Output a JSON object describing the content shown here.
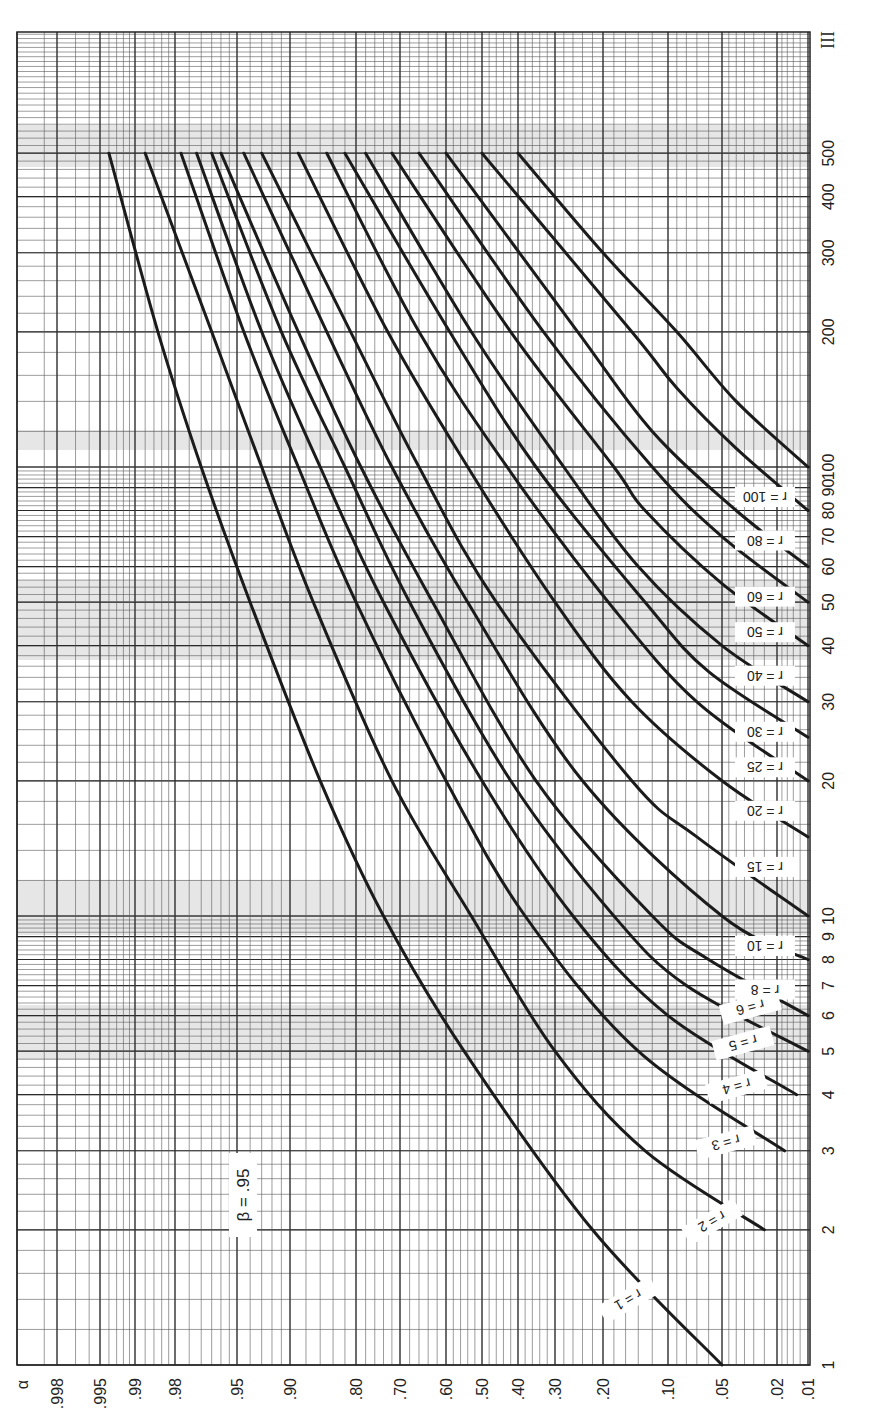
{
  "chart_data": {
    "type": "line",
    "title": "β = .95",
    "orientation": "rotated 90° (n axis vertical on right, α axis horizontal at bottom)",
    "beta_label": "β = .95",
    "page_label": "III",
    "xlabel": "α",
    "ylabel": "n",
    "x_axis": {
      "scale": "normal-probability (decreasing to the right)",
      "ticks": [
        ".998",
        ".995",
        ".99",
        ".98",
        ".95",
        ".90",
        ".80",
        ".70",
        ".60",
        ".50",
        ".40",
        ".30",
        ".20",
        ".10",
        ".05",
        ".02",
        ".01"
      ],
      "tick_values": [
        0.998,
        0.995,
        0.99,
        0.98,
        0.95,
        0.9,
        0.8,
        0.7,
        0.6,
        0.5,
        0.4,
        0.3,
        0.2,
        0.1,
        0.05,
        0.02,
        0.01
      ],
      "label": "α"
    },
    "y_axis": {
      "scale": "log",
      "ticks": [
        "1",
        "2",
        "3",
        "4",
        "5",
        "6",
        "7",
        "8",
        "9",
        "10",
        "15",
        "20",
        "30",
        "40",
        "50",
        "60",
        "70",
        "80",
        "90",
        "100",
        "200",
        "300",
        "400",
        "500"
      ],
      "tick_values": [
        1,
        2,
        3,
        4,
        5,
        6,
        7,
        8,
        9,
        10,
        20,
        30,
        40,
        50,
        60,
        70,
        80,
        90,
        100,
        200,
        300,
        400,
        500
      ],
      "range": [
        1,
        1000
      ]
    },
    "grid": true,
    "series": [
      {
        "name": "r = 1",
        "r": 1,
        "points": [
          {
            "n": 1,
            "alpha": 0.05
          },
          {
            "n": 2,
            "alpha": 0.22
          },
          {
            "n": 5,
            "alpha": 0.55
          },
          {
            "n": 10,
            "alpha": 0.74
          },
          {
            "n": 20,
            "alpha": 0.86
          },
          {
            "n": 50,
            "alpha": 0.94
          },
          {
            "n": 100,
            "alpha": 0.97
          },
          {
            "n": 200,
            "alpha": 0.985
          },
          {
            "n": 500,
            "alpha": 0.994
          }
        ]
      },
      {
        "name": "r = 2",
        "r": 2,
        "points": [
          {
            "n": 2,
            "alpha": 0.025
          },
          {
            "n": 3,
            "alpha": 0.13
          },
          {
            "n": 5,
            "alpha": 0.3
          },
          {
            "n": 10,
            "alpha": 0.53
          },
          {
            "n": 20,
            "alpha": 0.72
          },
          {
            "n": 50,
            "alpha": 0.87
          },
          {
            "n": 100,
            "alpha": 0.93
          },
          {
            "n": 200,
            "alpha": 0.965
          },
          {
            "n": 500,
            "alpha": 0.988
          }
        ]
      },
      {
        "name": "r = 3",
        "r": 3,
        "points": [
          {
            "n": 3,
            "alpha": 0.017
          },
          {
            "n": 5,
            "alpha": 0.14
          },
          {
            "n": 10,
            "alpha": 0.38
          },
          {
            "n": 20,
            "alpha": 0.6
          },
          {
            "n": 50,
            "alpha": 0.8
          },
          {
            "n": 100,
            "alpha": 0.89
          },
          {
            "n": 200,
            "alpha": 0.945
          },
          {
            "n": 500,
            "alpha": 0.978
          }
        ]
      },
      {
        "name": "r = 4",
        "r": 4,
        "points": [
          {
            "n": 4,
            "alpha": 0.013
          },
          {
            "n": 6,
            "alpha": 0.1
          },
          {
            "n": 10,
            "alpha": 0.26
          },
          {
            "n": 20,
            "alpha": 0.5
          },
          {
            "n": 50,
            "alpha": 0.74
          },
          {
            "n": 100,
            "alpha": 0.86
          },
          {
            "n": 200,
            "alpha": 0.93
          },
          {
            "n": 500,
            "alpha": 0.972
          }
        ]
      },
      {
        "name": "r = 5",
        "r": 5,
        "points": [
          {
            "n": 5,
            "alpha": 0.01
          },
          {
            "n": 7,
            "alpha": 0.08
          },
          {
            "n": 10,
            "alpha": 0.18
          },
          {
            "n": 20,
            "alpha": 0.42
          },
          {
            "n": 50,
            "alpha": 0.68
          },
          {
            "n": 100,
            "alpha": 0.82
          },
          {
            "n": 200,
            "alpha": 0.91
          },
          {
            "n": 500,
            "alpha": 0.965
          }
        ]
      },
      {
        "name": "r = 6",
        "r": 6,
        "points": [
          {
            "n": 6,
            "alpha": 0.01
          },
          {
            "n": 8,
            "alpha": 0.06
          },
          {
            "n": 10,
            "alpha": 0.12
          },
          {
            "n": 20,
            "alpha": 0.35
          },
          {
            "n": 50,
            "alpha": 0.63
          },
          {
            "n": 100,
            "alpha": 0.79
          },
          {
            "n": 200,
            "alpha": 0.89
          },
          {
            "n": 500,
            "alpha": 0.96
          }
        ]
      },
      {
        "name": "r = 8",
        "r": 8,
        "points": [
          {
            "n": 8,
            "alpha": 0.01
          },
          {
            "n": 10,
            "alpha": 0.05
          },
          {
            "n": 20,
            "alpha": 0.24
          },
          {
            "n": 50,
            "alpha": 0.54
          },
          {
            "n": 100,
            "alpha": 0.72
          },
          {
            "n": 200,
            "alpha": 0.85
          },
          {
            "n": 500,
            "alpha": 0.945
          }
        ]
      },
      {
        "name": "r = 10",
        "r": 10,
        "points": [
          {
            "n": 10,
            "alpha": 0.01
          },
          {
            "n": 15,
            "alpha": 0.07
          },
          {
            "n": 20,
            "alpha": 0.15
          },
          {
            "n": 50,
            "alpha": 0.46
          },
          {
            "n": 100,
            "alpha": 0.66
          },
          {
            "n": 200,
            "alpha": 0.81
          },
          {
            "n": 500,
            "alpha": 0.93
          }
        ]
      },
      {
        "name": "r = 15",
        "r": 15,
        "points": [
          {
            "n": 15,
            "alpha": 0.01
          },
          {
            "n": 20,
            "alpha": 0.05
          },
          {
            "n": 30,
            "alpha": 0.15
          },
          {
            "n": 50,
            "alpha": 0.3
          },
          {
            "n": 100,
            "alpha": 0.54
          },
          {
            "n": 200,
            "alpha": 0.73
          },
          {
            "n": 500,
            "alpha": 0.89
          }
        ]
      },
      {
        "name": "r = 20",
        "r": 20,
        "points": [
          {
            "n": 20,
            "alpha": 0.01
          },
          {
            "n": 30,
            "alpha": 0.07
          },
          {
            "n": 50,
            "alpha": 0.19
          },
          {
            "n": 100,
            "alpha": 0.43
          },
          {
            "n": 200,
            "alpha": 0.66
          },
          {
            "n": 500,
            "alpha": 0.85
          }
        ]
      },
      {
        "name": "r = 25",
        "r": 25,
        "points": [
          {
            "n": 25,
            "alpha": 0.01
          },
          {
            "n": 35,
            "alpha": 0.06
          },
          {
            "n": 50,
            "alpha": 0.13
          },
          {
            "n": 100,
            "alpha": 0.35
          },
          {
            "n": 200,
            "alpha": 0.59
          },
          {
            "n": 500,
            "alpha": 0.82
          }
        ]
      },
      {
        "name": "r = 30",
        "r": 30,
        "points": [
          {
            "n": 30,
            "alpha": 0.01
          },
          {
            "n": 40,
            "alpha": 0.05
          },
          {
            "n": 60,
            "alpha": 0.14
          },
          {
            "n": 100,
            "alpha": 0.28
          },
          {
            "n": 200,
            "alpha": 0.53
          },
          {
            "n": 500,
            "alpha": 0.78
          }
        ]
      },
      {
        "name": "r = 40",
        "r": 40,
        "points": [
          {
            "n": 40,
            "alpha": 0.01
          },
          {
            "n": 55,
            "alpha": 0.05
          },
          {
            "n": 80,
            "alpha": 0.13
          },
          {
            "n": 100,
            "alpha": 0.18
          },
          {
            "n": 200,
            "alpha": 0.42
          },
          {
            "n": 500,
            "alpha": 0.72
          }
        ]
      },
      {
        "name": "r = 50",
        "r": 50,
        "points": [
          {
            "n": 50,
            "alpha": 0.01
          },
          {
            "n": 70,
            "alpha": 0.05
          },
          {
            "n": 100,
            "alpha": 0.12
          },
          {
            "n": 200,
            "alpha": 0.33
          },
          {
            "n": 500,
            "alpha": 0.66
          }
        ]
      },
      {
        "name": "r = 60",
        "r": 60,
        "points": [
          {
            "n": 60,
            "alpha": 0.01
          },
          {
            "n": 80,
            "alpha": 0.04
          },
          {
            "n": 120,
            "alpha": 0.12
          },
          {
            "n": 200,
            "alpha": 0.25
          },
          {
            "n": 500,
            "alpha": 0.6
          }
        ]
      },
      {
        "name": "r = 80",
        "r": 80,
        "points": [
          {
            "n": 80,
            "alpha": 0.01
          },
          {
            "n": 110,
            "alpha": 0.04
          },
          {
            "n": 150,
            "alpha": 0.09
          },
          {
            "n": 200,
            "alpha": 0.15
          },
          {
            "n": 500,
            "alpha": 0.5
          }
        ]
      },
      {
        "name": "r = 100",
        "r": 100,
        "points": [
          {
            "n": 100,
            "alpha": 0.01
          },
          {
            "n": 140,
            "alpha": 0.04
          },
          {
            "n": 200,
            "alpha": 0.09
          },
          {
            "n": 300,
            "alpha": 0.2
          },
          {
            "n": 500,
            "alpha": 0.4
          }
        ]
      }
    ]
  },
  "labels": {
    "beta": "β = .95",
    "page": "III",
    "curve_labels": [
      "r = 1",
      "r = 2",
      "r = 3",
      "r = 4",
      "r = 5",
      "r = 6",
      "r = 8",
      "r = 10",
      "r = 15",
      "r = 20",
      "r = 25",
      "r = 30",
      "r = 40",
      "r = 50",
      "r = 60",
      "r = 80",
      "r = 100"
    ]
  }
}
